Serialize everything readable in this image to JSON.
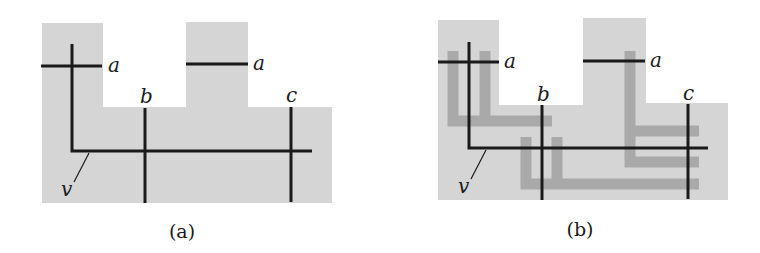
{
  "colors": {
    "region_fill": "#d5d5d5",
    "route_stroke": "#a9a9a9",
    "wire_stroke": "#1a1a1a",
    "background": "#ffffff"
  },
  "panels": [
    {
      "id": "a",
      "caption": "(a)",
      "caption_pos": [
        182,
        238
      ],
      "region_points": "42,23 103,23 103,107 186,107 186,22 248,22 248,107 332,107 332,203 42,203",
      "wires": [
        {
          "name": "terminal-a-left",
          "d": "M41,66 L102,66"
        },
        {
          "name": "terminal-a-right",
          "d": "M186,64 L248,64"
        },
        {
          "name": "net-v",
          "d": "M72,44 L72,151 L312,151"
        },
        {
          "name": "terminal-b",
          "d": "M145,108 L145,203"
        },
        {
          "name": "terminal-c",
          "d": "M291,107 L291,202"
        }
      ],
      "routes": [],
      "labels": [
        {
          "name": "label-a-left",
          "text": "a",
          "x": 108,
          "y": 72
        },
        {
          "name": "label-a-right",
          "text": "a",
          "x": 253,
          "y": 70
        },
        {
          "name": "label-b",
          "text": "b",
          "x": 140,
          "y": 103
        },
        {
          "name": "label-c",
          "text": "c",
          "x": 286,
          "y": 102
        },
        {
          "name": "label-v",
          "text": "v",
          "x": 61,
          "y": 196
        }
      ],
      "leader": {
        "d": "M89,153 L74,182"
      }
    },
    {
      "id": "b",
      "caption": "(b)",
      "caption_pos": [
        580,
        236
      ],
      "region_points": "438,20 499,20 499,105 583,105 583,18 646,18 646,103 728,103 728,200 438,200",
      "wires": [
        {
          "name": "terminal-a-left",
          "d": "M438,62 L499,62"
        },
        {
          "name": "terminal-a-right",
          "d": "M583,61 L645,61"
        },
        {
          "name": "net-v",
          "d": "M469,42 L469,148 L708,148"
        },
        {
          "name": "terminal-b",
          "d": "M542,105 L542,200"
        },
        {
          "name": "terminal-c",
          "d": "M688,104 L688,199"
        }
      ],
      "routes": [
        {
          "name": "route-left-u",
          "d": "M453,51 L453,121 L485,121 L485,51 M485,121 L552,121"
        },
        {
          "name": "route-middle-u",
          "d": "M526,137 L526,184 L557,184 L557,137 M557,184 L699,184"
        },
        {
          "name": "route-right-e",
          "d": "M630,51 L630,162 L699,162 M630,131 L699,131"
        }
      ],
      "labels": [
        {
          "name": "label-a-left",
          "text": "a",
          "x": 504,
          "y": 68
        },
        {
          "name": "label-a-right",
          "text": "a",
          "x": 650,
          "y": 67
        },
        {
          "name": "label-b",
          "text": "b",
          "x": 537,
          "y": 101
        },
        {
          "name": "label-c",
          "text": "c",
          "x": 683,
          "y": 100
        },
        {
          "name": "label-v",
          "text": "v",
          "x": 458,
          "y": 193
        }
      ],
      "leader": {
        "d": "M486,150 L471,179"
      }
    }
  ]
}
